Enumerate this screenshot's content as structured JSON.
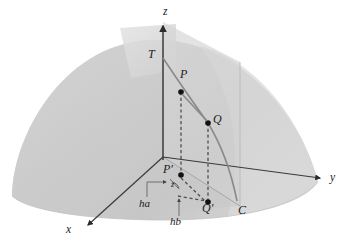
{
  "figure": {
    "kind": "3d-geometry-diagram",
    "background_color": "#ffffff"
  },
  "colors": {
    "surface_fill": "#cdcdcd",
    "surface_fill_dark": "#c2c2c2",
    "surface_fill_light": "#d8d8d8",
    "plane_fill": "#d4d4d4",
    "tilted_plane_fill": "#dcdcdc",
    "axis_stroke": "#3a3a3a",
    "curve_stroke": "#7a7a7a",
    "dashed_stroke": "#5a5a5a",
    "leader_stroke": "#6e6e6e",
    "point_fill": "#111111",
    "label_color": "#1a1a1a"
  },
  "axes": [
    {
      "id": "z",
      "label": "z",
      "label_x": 166,
      "label_y": 12,
      "direction": "up"
    },
    {
      "id": "y",
      "label": "y",
      "label_x": 332,
      "label_y": 176,
      "direction": "right-down"
    },
    {
      "id": "x",
      "label": "x",
      "label_x": 67,
      "label_y": 226,
      "direction": "left-down"
    }
  ],
  "points": [
    {
      "id": "T",
      "label": "T",
      "dot": false,
      "label_x": 150,
      "label_y": 51,
      "cx": 163,
      "cy": 58
    },
    {
      "id": "P",
      "label": "P",
      "dot": true,
      "label_x": 181,
      "label_y": 72,
      "cx": 181,
      "cy": 92
    },
    {
      "id": "Q",
      "label": "Q",
      "dot": true,
      "label_x": 214,
      "label_y": 116,
      "cx": 208,
      "cy": 123
    },
    {
      "id": "Pp",
      "label": "P'",
      "dot": true,
      "label_x": 164,
      "label_y": 165,
      "cx": 181,
      "cy": 175
    },
    {
      "id": "Qp",
      "label": "Q'",
      "dot": true,
      "label_x": 203,
      "label_y": 203,
      "cx": 208,
      "cy": 202
    },
    {
      "id": "C",
      "label": "C",
      "dot": false,
      "label_x": 239,
      "label_y": 207,
      "cx": 239,
      "cy": 207
    }
  ],
  "annotations": [
    {
      "id": "ha",
      "label": "ha",
      "label_x": 141,
      "label_y": 200,
      "kind": "leader-elbow"
    },
    {
      "id": "hb",
      "label": "hb",
      "label_x": 171,
      "label_y": 218,
      "kind": "leader-arrow"
    },
    {
      "id": "zsml",
      "label": "z",
      "label_x": 171,
      "label_y": 181,
      "kind": "angle-mark"
    }
  ],
  "geometry": {
    "origin": {
      "x": 163,
      "y": 157
    },
    "z_axis_tip": {
      "x": 163,
      "y": 22
    },
    "y_axis_tip": {
      "x": 324,
      "y": 179
    },
    "x_axis_tip": {
      "x": 84,
      "y": 227
    },
    "curve_C_label_anchor": {
      "x": 239,
      "y": 207
    }
  }
}
